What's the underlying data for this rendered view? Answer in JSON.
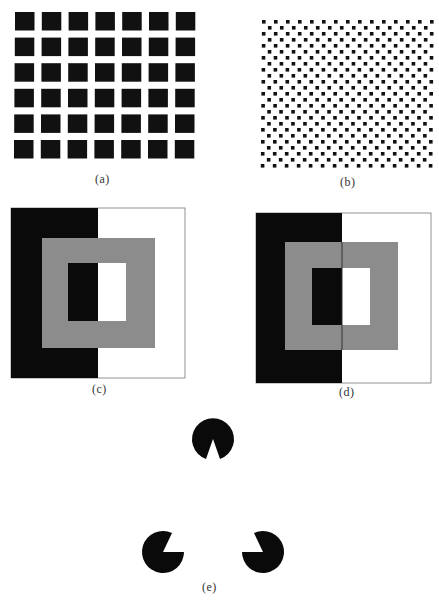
{
  "figure": {
    "panels": [
      {
        "id": "a",
        "label": "(a)",
        "description": "grid of 7x6 black squares (Hermann grid)",
        "cols": 7,
        "rows": 6
      },
      {
        "id": "b",
        "label": "(b)",
        "description": "checkerboard of small black dots"
      },
      {
        "id": "c",
        "label": "(c)",
        "description": "gray ring over black/white split background (simultaneous contrast)",
        "colors": {
          "black": "#0a0a0a",
          "gray": "#8c8c8c",
          "white": "#ffffff"
        }
      },
      {
        "id": "d",
        "label": "(d)",
        "description": "gray ring split by thin line over black/white background",
        "colors": {
          "black": "#0a0a0a",
          "gray": "#8c8c8c",
          "white": "#ffffff"
        }
      },
      {
        "id": "e",
        "label": "(e)",
        "description": "three pac-man inducers forming illusory (Kanizsa) triangle"
      }
    ],
    "caption": ""
  }
}
